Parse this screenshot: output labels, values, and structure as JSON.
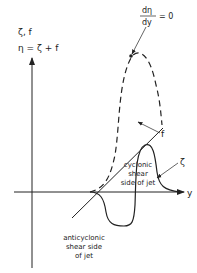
{
  "diagram": {
    "y_axis_label_line1": "ζ, f",
    "y_axis_label_line2": "η = ζ + f",
    "x_axis_label": "y",
    "eta_peak_label_num": "dη",
    "eta_peak_label_den": "dy",
    "eta_peak_label_eq": "= 0",
    "f_label": "f",
    "zeta_label": "ζ",
    "cyclonic_label": [
      "cyclonic",
      "shear",
      "side of jet"
    ],
    "anticyclonic_label": [
      "anticyclonic",
      "shear side",
      "of jet"
    ],
    "curves": [
      {
        "name": "eta",
        "style": "dashed",
        "description": "absolute vorticity η = ζ + f"
      },
      {
        "name": "f",
        "style": "solid-straight",
        "description": "planetary vorticity f"
      },
      {
        "name": "zeta",
        "style": "solid",
        "description": "relative vorticity ζ"
      }
    ],
    "colors": {
      "line": "#222222",
      "background": "#ffffff"
    }
  }
}
